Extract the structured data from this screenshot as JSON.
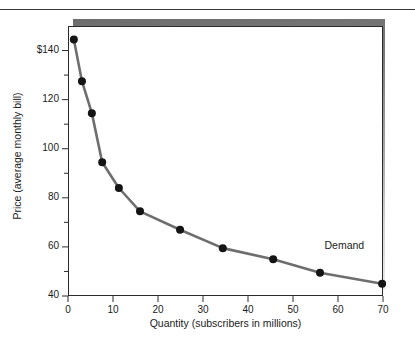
{
  "chart_data": {
    "type": "line",
    "title": "",
    "xlabel": "Quantity (subscribers in millions)",
    "ylabel": "Price (average monthly bill)",
    "xlim": [
      0,
      70
    ],
    "ylim": [
      40,
      150
    ],
    "grid": false,
    "legend": "none",
    "annotations": [
      {
        "text": "Demand",
        "x": 57,
        "y": 60
      }
    ],
    "xticks": [
      0,
      10,
      20,
      30,
      40,
      50,
      60,
      70
    ],
    "xtick_labels": [
      "0",
      "10",
      "20",
      "30",
      "40",
      "50",
      "60",
      "70"
    ],
    "yticks": [
      40,
      50,
      60,
      70,
      80,
      90,
      100,
      110,
      120,
      130,
      140
    ],
    "ytick_labels": [
      "40",
      "",
      "60",
      "",
      "80",
      "",
      "100",
      "",
      "120",
      "",
      "$140"
    ],
    "ytick_major": [
      40,
      60,
      80,
      100,
      120,
      140
    ],
    "series": [
      {
        "name": "Demand",
        "color": "#6e6e6e",
        "marker_color": "#141414",
        "x": [
          1.3,
          3.1,
          5.3,
          7.6,
          11.3,
          16.0,
          24.9,
          34.4,
          45.6,
          56.0,
          69.8
        ],
        "y": [
          144.5,
          127.5,
          114.5,
          94.5,
          84.0,
          74.5,
          67.0,
          59.5,
          55.0,
          49.5,
          45.0
        ]
      }
    ]
  },
  "axis": {
    "y_label_text": "Price (average monthly bill)",
    "x_label_text": "Quantity (subscribers in millions)"
  },
  "annotation": {
    "demand_label": "Demand"
  }
}
